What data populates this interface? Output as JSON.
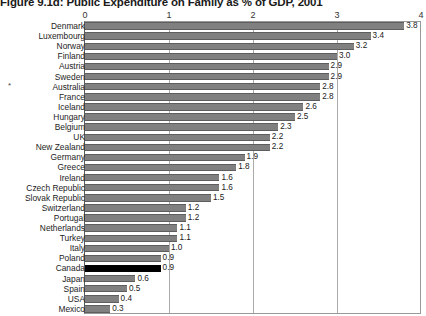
{
  "chart_data": {
    "type": "bar",
    "orientation": "horizontal",
    "title": "Figure 9.1d: Public Expenditure on Family as % of GDP, 2001",
    "xlabel": "",
    "ylabel": "",
    "xlim": [
      0,
      4
    ],
    "xticks": [
      "0",
      "1",
      "2",
      "3",
      "4"
    ],
    "grid": true,
    "legend": "none",
    "highlight_category": "Canada",
    "highlight_color": "#000000",
    "bar_color": "#808080",
    "categories": [
      "Denmark",
      "Luxembourg",
      "Norway",
      "Finland",
      "Austria",
      "Sweden",
      "Australia",
      "France",
      "Iceland",
      "Hungary",
      "Belgium",
      "UK",
      "New Zealand",
      "Germany",
      "Greece",
      "Ireland",
      "Czech Republic",
      "Slovak Republic",
      "Switzerland",
      "Portugal",
      "Netherlands",
      "Turkey",
      "Italy",
      "Poland",
      "Canada",
      "Japan",
      "Spain",
      "USA",
      "Mexico"
    ],
    "values": [
      3.8,
      3.4,
      3.2,
      3.0,
      2.9,
      2.9,
      2.8,
      2.8,
      2.6,
      2.5,
      2.3,
      2.2,
      2.2,
      1.9,
      1.8,
      1.6,
      1.6,
      1.5,
      1.2,
      1.2,
      1.1,
      1.1,
      1.0,
      0.9,
      0.9,
      0.6,
      0.5,
      0.4,
      0.3
    ],
    "value_labels": [
      "3.8",
      "3.4",
      "3.2",
      "3.0",
      "2.9",
      "2.9",
      "2.8",
      "2.8",
      "2.6",
      "2.5",
      "2.3",
      "2.2",
      "2.2",
      "1.9",
      "1.8",
      "1.6",
      "1.6",
      "1.5",
      "1.2",
      "1.2",
      "1.1",
      "1.1",
      "1.0",
      "0.9",
      "0.9",
      "0.6",
      "0.5",
      "0.4",
      "0.3"
    ],
    "annotations": [
      {
        "category": "Australia",
        "marker": "*"
      }
    ]
  }
}
